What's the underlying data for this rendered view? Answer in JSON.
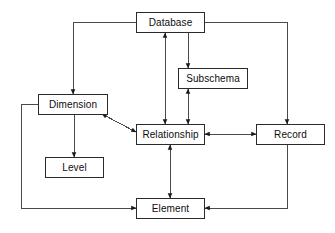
{
  "diagram": {
    "background_color": "#ffffff",
    "line_color": "#4a4a4a",
    "arrow_color": "#1a1a1a",
    "box_border_color": "#2b2b2b",
    "box_fill_color": "#ffffff",
    "text_color": "#0d0d0d",
    "nodes": [
      {
        "id": "database",
        "label": "Database",
        "x": 136,
        "y": 12,
        "w": 69,
        "h": 21
      },
      {
        "id": "subschema",
        "label": "Subschema",
        "x": 178,
        "y": 68,
        "w": 70,
        "h": 21
      },
      {
        "id": "dimension",
        "label": "Dimension",
        "x": 38,
        "y": 94,
        "w": 70,
        "h": 21
      },
      {
        "id": "relationship",
        "label": "Relationship",
        "x": 136,
        "y": 124,
        "w": 69,
        "h": 21
      },
      {
        "id": "record",
        "label": "Record",
        "x": 256,
        "y": 124,
        "w": 69,
        "h": 21
      },
      {
        "id": "level",
        "label": "Level",
        "x": 45,
        "y": 157,
        "w": 59,
        "h": 21
      },
      {
        "id": "element",
        "label": "Element",
        "x": 136,
        "y": 198,
        "w": 69,
        "h": 21
      }
    ],
    "edges": [
      {
        "id": "database-to-dimension",
        "from": "database",
        "to": "dimension",
        "arrows": "single",
        "route": "orthogonal-left"
      },
      {
        "id": "database-to-subschema",
        "from": "database",
        "to": "subschema",
        "arrows": "single",
        "route": "vertical"
      },
      {
        "id": "database-to-record",
        "from": "database",
        "to": "record",
        "arrows": "single",
        "route": "orthogonal-right"
      },
      {
        "id": "database-relationship",
        "from": "database",
        "to": "relationship",
        "arrows": "double",
        "route": "vertical"
      },
      {
        "id": "subschema-relationship",
        "from": "subschema",
        "to": "relationship",
        "arrows": "double",
        "route": "vertical"
      },
      {
        "id": "dimension-relationship",
        "from": "dimension",
        "to": "relationship",
        "arrows": "double",
        "route": "diagonal"
      },
      {
        "id": "dimension-to-level",
        "from": "dimension",
        "to": "level",
        "arrows": "single",
        "route": "vertical"
      },
      {
        "id": "dimension-to-element",
        "from": "dimension",
        "to": "element",
        "arrows": "single",
        "route": "orthogonal-left"
      },
      {
        "id": "relationship-element",
        "from": "relationship",
        "to": "element",
        "arrows": "double",
        "route": "vertical"
      },
      {
        "id": "relationship-record",
        "from": "relationship",
        "to": "record",
        "arrows": "double",
        "route": "horizontal"
      },
      {
        "id": "record-to-element",
        "from": "record",
        "to": "element",
        "arrows": "single",
        "route": "orthogonal-right"
      }
    ]
  }
}
